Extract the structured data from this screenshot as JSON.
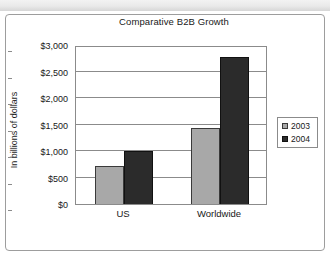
{
  "top_strip": {
    "left_ghost_text": "",
    "right_ghost_text": ""
  },
  "chart_data": {
    "type": "bar",
    "title": "Comparative B2B Growth",
    "xlabel": "",
    "ylabel": "In billions of dollars",
    "categories": [
      "US",
      "Worldwide"
    ],
    "series": [
      {
        "name": "2003",
        "color": "#a8a8a8",
        "values": [
          725,
          1430
        ]
      },
      {
        "name": "2004",
        "color": "#2b2b2b",
        "values": [
          1000,
          2780
        ]
      }
    ],
    "ylim": [
      0,
      3000
    ],
    "ytick_values": [
      0,
      500,
      1000,
      1500,
      2000,
      2500,
      3000
    ],
    "ytick_labels": [
      "$0",
      "$500",
      "$1,000",
      "$1,500",
      "$2,000",
      "$2,500",
      "$3,000"
    ],
    "grid": true,
    "legend_position": "right",
    "legend_entries": [
      "2003",
      "2004"
    ]
  }
}
